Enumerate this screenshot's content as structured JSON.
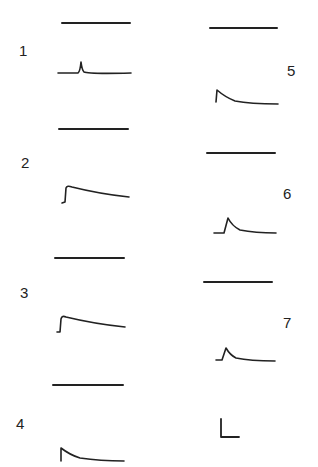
{
  "figure": {
    "panels": [
      {
        "id": "1",
        "label": "1",
        "reference": "flat baseline",
        "response": "brief spike"
      },
      {
        "id": "2",
        "label": "2",
        "reference": "flat baseline",
        "response": "step rise with slow decay"
      },
      {
        "id": "3",
        "label": "3",
        "reference": "flat baseline",
        "response": "step rise with slow decay"
      },
      {
        "id": "4",
        "label": "4",
        "reference": "flat baseline",
        "response": "fast rise with exponential decay"
      },
      {
        "id": "5",
        "label": "5",
        "reference": "flat baseline",
        "response": "fast rise with exponential decay"
      },
      {
        "id": "6",
        "label": "6",
        "reference": "flat baseline",
        "response": "transient peak with decay"
      },
      {
        "id": "7",
        "label": "7",
        "reference": "flat baseline",
        "response": "transient peak with decay"
      }
    ],
    "scale_bar": {
      "icon": "scale-bar-l-shape"
    },
    "colors": {
      "ink": "#222222",
      "background": "#ffffff"
    }
  }
}
